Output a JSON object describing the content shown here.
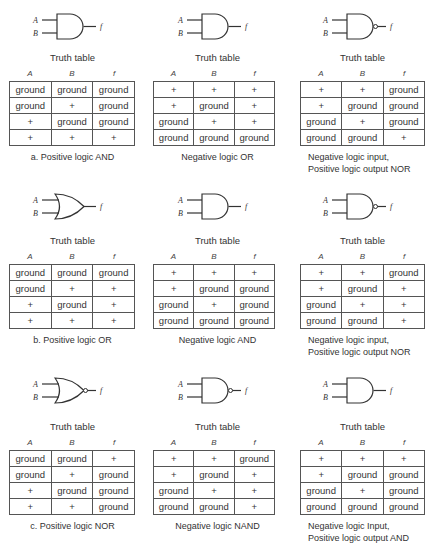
{
  "columns": [
    "A",
    "B",
    "f"
  ],
  "truth_table_label": "Truth table",
  "panels": [
    {
      "gate": "AND",
      "caption": [
        "a. Positive logic AND"
      ],
      "rows": [
        [
          "ground",
          "ground",
          "ground"
        ],
        [
          "ground",
          "+",
          "ground"
        ],
        [
          "+",
          "ground",
          "ground"
        ],
        [
          "+",
          "+",
          "+"
        ]
      ]
    },
    {
      "gate": "AND",
      "caption": [
        "Negative logic OR"
      ],
      "rows": [
        [
          "+",
          "+",
          "+"
        ],
        [
          "+",
          "ground",
          "+"
        ],
        [
          "ground",
          "+",
          "+"
        ],
        [
          "ground",
          "ground",
          "ground"
        ]
      ]
    },
    {
      "gate": "NAND",
      "caption": [
        "Negative logic input,",
        "Positive logic output NOR"
      ],
      "rows": [
        [
          "+",
          "+",
          "ground"
        ],
        [
          "+",
          "ground",
          "ground"
        ],
        [
          "ground",
          "+",
          "ground"
        ],
        [
          "ground",
          "ground",
          "+"
        ]
      ]
    },
    {
      "gate": "OR",
      "caption": [
        "b. Positive logic OR"
      ],
      "rows": [
        [
          "ground",
          "ground",
          "ground"
        ],
        [
          "ground",
          "+",
          "+"
        ],
        [
          "+",
          "ground",
          "+"
        ],
        [
          "+",
          "+",
          "+"
        ]
      ]
    },
    {
      "gate": "AND",
      "caption": [
        "Negative logic AND"
      ],
      "rows": [
        [
          "+",
          "+",
          "+"
        ],
        [
          "+",
          "ground",
          "ground"
        ],
        [
          "ground",
          "+",
          "ground"
        ],
        [
          "ground",
          "ground",
          "ground"
        ]
      ]
    },
    {
      "gate": "NAND",
      "caption": [
        "Negative logic input,",
        "Positive logic output NOR"
      ],
      "rows": [
        [
          "+",
          "+",
          "ground"
        ],
        [
          "+",
          "ground",
          "+"
        ],
        [
          "ground",
          "+",
          "+"
        ],
        [
          "ground",
          "ground",
          "+"
        ]
      ]
    },
    {
      "gate": "NOR",
      "caption": [
        "c. Positive logic NOR"
      ],
      "rows": [
        [
          "ground",
          "ground",
          "+"
        ],
        [
          "ground",
          "+",
          "ground"
        ],
        [
          "+",
          "ground",
          "ground"
        ],
        [
          "+",
          "+",
          "ground"
        ]
      ]
    },
    {
      "gate": "NAND",
      "caption": [
        "Negative logic NAND"
      ],
      "rows": [
        [
          "+",
          "+",
          "ground"
        ],
        [
          "+",
          "ground",
          "+"
        ],
        [
          "ground",
          "+",
          "+"
        ],
        [
          "ground",
          "ground",
          "+"
        ]
      ]
    },
    {
      "gate": "AND",
      "caption": [
        "Negative logic Input,",
        "Positive logic output AND"
      ],
      "rows": [
        [
          "+",
          "+",
          "+"
        ],
        [
          "+",
          "ground",
          "ground"
        ],
        [
          "ground",
          "+",
          "ground"
        ],
        [
          "ground",
          "ground",
          "ground"
        ]
      ]
    }
  ]
}
